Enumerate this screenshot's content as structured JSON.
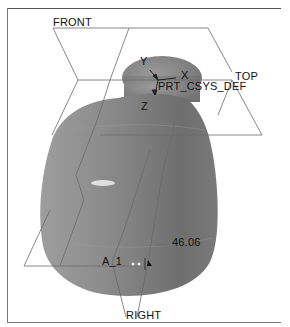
{
  "viewport": {
    "datum_planes": [
      {
        "id": "front",
        "label": "FRONT"
      },
      {
        "id": "top",
        "label": "TOP"
      },
      {
        "id": "right",
        "label": "RIGHT"
      }
    ],
    "coordinate_system": {
      "name": "PRT_CSYS_DEF",
      "axes": {
        "x": "X",
        "y": "Y",
        "z": "Z"
      }
    },
    "axis_label": "A_1",
    "dimension_value": "46.06",
    "colors": {
      "background": "#ffffff",
      "model_shade": "#8a8a8a",
      "datum_line": "#6a6a6a",
      "text": "#111111"
    }
  }
}
